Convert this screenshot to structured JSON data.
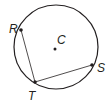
{
  "diagram": {
    "type": "circle-chords",
    "circle": {
      "center_label": "C",
      "cx": 56,
      "cy": 47,
      "r": 42
    },
    "points": [
      {
        "label": "R",
        "x": 21,
        "y": 30,
        "label_x": 9,
        "label_y": 33
      },
      {
        "label": "S",
        "x": 92,
        "y": 65,
        "label_x": 97,
        "label_y": 72
      },
      {
        "label": "T",
        "x": 35,
        "y": 82,
        "label_x": 28,
        "label_y": 100
      },
      {
        "label": "C",
        "x": 55,
        "y": 49,
        "label_x": 57,
        "label_y": 44
      }
    ],
    "segments": [
      {
        "from": "R",
        "to": "T"
      },
      {
        "from": "T",
        "to": "S"
      }
    ],
    "stroke_color": "#231f20"
  }
}
